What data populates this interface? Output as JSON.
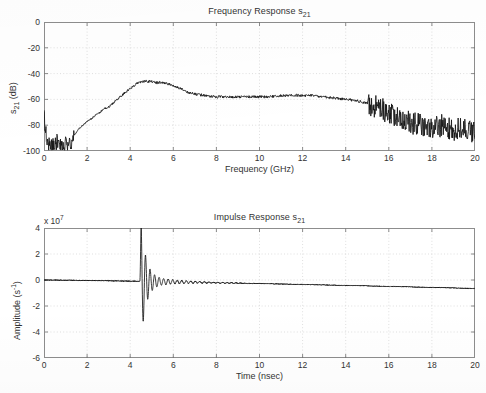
{
  "figure": {
    "background": "#ffffff",
    "trace_color": "#131313",
    "grid_color": "#c9c9c9",
    "axis_color": "#8d8d8d"
  },
  "subplots": [
    {
      "name": "frequency-response",
      "title": "Frequency Response s21",
      "title_base": "Frequency Response s",
      "title_sub": "21",
      "xlabel": "Frequency (GHz)",
      "ylabel_base": "s",
      "ylabel_sub": "21",
      "ylabel_tail": " (dB)",
      "ylabel": "s21 (dB)",
      "xticks": [
        "0",
        "2",
        "4",
        "6",
        "8",
        "10",
        "12",
        "14",
        "16",
        "18",
        "20"
      ],
      "yticks": [
        "0",
        "-20",
        "-40",
        "-60",
        "-80",
        "-100"
      ],
      "exponent_label": ""
    },
    {
      "name": "impulse-response",
      "title": "Impulse Response s21",
      "title_base": "Impulse Response s",
      "title_sub": "21",
      "xlabel": "Time (nsec)",
      "ylabel_base": "Amplitude (s",
      "ylabel_sup": "-1",
      "ylabel_tail": ")",
      "ylabel": "Amplitude (s-1)",
      "xticks": [
        "0",
        "2",
        "4",
        "6",
        "8",
        "10",
        "12",
        "14",
        "16",
        "18",
        "20"
      ],
      "yticks": [
        "4",
        "2",
        "0",
        "-2",
        "-4",
        "-6"
      ],
      "exponent_base": "x 10",
      "exponent_sup": "7",
      "exponent_label": "x 10^7"
    }
  ],
  "chart_data": [
    {
      "type": "line",
      "name": "frequency-response",
      "title": "Frequency Response s21",
      "xlabel": "Frequency (GHz)",
      "ylabel": "s21 (dB)",
      "xlim": [
        0,
        20
      ],
      "ylim": [
        -100,
        0
      ],
      "xticks": [
        0,
        2,
        4,
        6,
        8,
        10,
        12,
        14,
        16,
        18,
        20
      ],
      "yticks": [
        0,
        -20,
        -40,
        -60,
        -80,
        -100
      ],
      "grid": true,
      "legend": "none",
      "noise_amplitude_db": {
        "below_1p4GHz": 6.0,
        "1p4_to_15GHz": 0.7,
        "above_15GHz": 9.0
      },
      "x": [
        0.0,
        0.1,
        0.2,
        0.3,
        0.4,
        0.5,
        0.6,
        0.7,
        0.8,
        0.9,
        1.0,
        1.1,
        1.2,
        1.3,
        1.4,
        1.6,
        1.8,
        2.0,
        2.2,
        2.4,
        2.6,
        2.8,
        3.0,
        3.2,
        3.4,
        3.6,
        3.8,
        4.0,
        4.2,
        4.4,
        4.6,
        4.8,
        5.0,
        5.2,
        5.4,
        5.6,
        5.8,
        6.0,
        6.2,
        6.4,
        6.6,
        6.8,
        7.0,
        7.5,
        8.0,
        8.5,
        9.0,
        9.5,
        10.0,
        10.5,
        11.0,
        11.5,
        12.0,
        12.5,
        13.0,
        13.5,
        14.0,
        14.5,
        15.0,
        15.5,
        16.0,
        16.5,
        17.0,
        17.5,
        18.0,
        18.5,
        19.0,
        19.5,
        20.0
      ],
      "y": [
        -72,
        -86,
        -93,
        -96,
        -94,
        -95,
        -92,
        -96,
        -94,
        -97,
        -93,
        -96,
        -92,
        -95,
        -88,
        -83,
        -80,
        -77,
        -75,
        -72,
        -70,
        -67,
        -66,
        -63,
        -60,
        -57,
        -54,
        -52,
        -49,
        -47,
        -46,
        -46,
        -46,
        -47,
        -47,
        -47,
        -48,
        -49,
        -51,
        -52,
        -54,
        -55,
        -56,
        -57,
        -58,
        -58,
        -58,
        -58,
        -58,
        -58,
        -57,
        -57,
        -57,
        -57,
        -58,
        -59,
        -60,
        -61,
        -63,
        -66,
        -70,
        -74,
        -78,
        -80,
        -82,
        -80,
        -84,
        -82,
        -86
      ]
    },
    {
      "type": "line",
      "name": "impulse-response",
      "title": "Impulse Response s21",
      "xlabel": "Time (nsec)",
      "ylabel": "Amplitude (s-1)",
      "y_scale_exponent": 7,
      "xlim": [
        0,
        20
      ],
      "ylim": [
        -6,
        4
      ],
      "xticks": [
        0,
        2,
        4,
        6,
        8,
        10,
        12,
        14,
        16,
        18,
        20
      ],
      "yticks": [
        4,
        2,
        0,
        -2,
        -4,
        -6
      ],
      "grid": true,
      "legend": "none",
      "features": {
        "impulse_onset_nsec": 4.45,
        "peak_positive_value": 2.7,
        "peak_positive_time_nsec": 4.6,
        "peak_negative_value": -5.2,
        "peak_negative_time_nsec": 4.65,
        "ringing_decay_until_nsec": 7.0,
        "baseline_start_value": 0.0,
        "baseline_end_value": -0.65
      },
      "x": [
        0.0,
        1.0,
        2.0,
        3.0,
        4.0,
        4.3,
        4.45,
        4.5,
        4.55,
        4.6,
        4.65,
        4.7,
        4.75,
        4.8,
        4.85,
        4.9,
        4.95,
        5.0,
        5.1,
        5.2,
        5.3,
        5.4,
        5.6,
        5.8,
        6.0,
        6.5,
        7.0,
        8.0,
        9.0,
        9.5,
        10.0,
        11.0,
        11.5,
        12.0,
        13.0,
        14.0,
        15.0,
        15.5,
        16.0,
        17.0,
        18.0,
        19.0,
        20.0
      ],
      "y": [
        0.0,
        -0.02,
        0.02,
        -0.02,
        0.03,
        -0.05,
        0.35,
        2.4,
        -3.1,
        2.7,
        -5.2,
        1.5,
        -2.1,
        1.55,
        -1.9,
        0.9,
        -0.8,
        0.55,
        -0.4,
        0.3,
        -0.25,
        0.22,
        -0.18,
        0.15,
        -0.12,
        0.1,
        -0.08,
        -0.1,
        -0.12,
        -0.18,
        -0.15,
        -0.2,
        -0.25,
        -0.28,
        -0.32,
        -0.38,
        -0.44,
        -0.48,
        -0.5,
        -0.55,
        -0.58,
        -0.62,
        -0.65
      ]
    }
  ]
}
